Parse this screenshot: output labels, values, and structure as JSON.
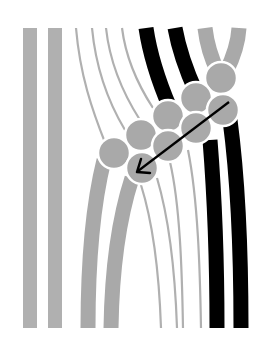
{
  "diagram": {
    "type": "illustration",
    "colors": {
      "background": "#ffffff",
      "gray_strand": "#aaaaaa",
      "thin_strand": "#b0b0b0",
      "black_strand": "#000000",
      "circle_fill": "#a9a9a9",
      "circle_stroke": "#ffffff",
      "arrow": "#000000"
    },
    "straight_bars": [
      {
        "x": 23,
        "width": 14,
        "y1": 28,
        "y2": 328
      },
      {
        "x": 48,
        "width": 14,
        "y1": 28,
        "y2": 328
      }
    ],
    "circles": [
      {
        "cx": 221,
        "cy": 78,
        "r": 16
      },
      {
        "cx": 196,
        "cy": 98,
        "r": 16
      },
      {
        "cx": 223,
        "cy": 110,
        "r": 16
      },
      {
        "cx": 168,
        "cy": 116,
        "r": 16
      },
      {
        "cx": 196,
        "cy": 128,
        "r": 16
      },
      {
        "cx": 141,
        "cy": 135,
        "r": 16
      },
      {
        "cx": 168,
        "cy": 146,
        "r": 16
      },
      {
        "cx": 114,
        "cy": 153,
        "r": 16
      },
      {
        "cx": 142,
        "cy": 168,
        "r": 16
      }
    ],
    "arrow": {
      "x1": 229,
      "y1": 102,
      "x2": 137,
      "y2": 172,
      "icon": "arrow-down-left-icon"
    }
  }
}
